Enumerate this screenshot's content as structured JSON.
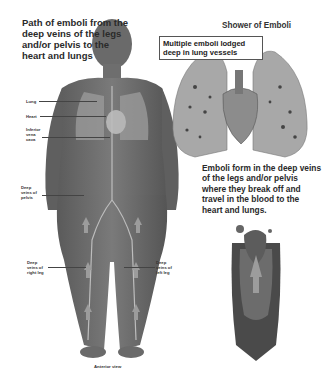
{
  "figure": {
    "left_title": "Path of emboli from the deep veins of the legs and/or pelvis to the heart and lungs",
    "right_title": "Shower of Emboli",
    "callout": "Multiple emboli lodged deep in lung vessels",
    "right_caption": "Emboli form in the deep veins of the legs and/or pelvis where they break off and travel in the blood to the heart and lungs.",
    "view_caption": "Anterior view",
    "body_labels": {
      "lung": "Lung",
      "heart": "Heart",
      "ivc": "Inferior vena cava",
      "pelvis": "Deep veins of pelvis",
      "right_leg": "Deep veins of right leg",
      "left_leg": "Deep veins of left leg"
    }
  }
}
